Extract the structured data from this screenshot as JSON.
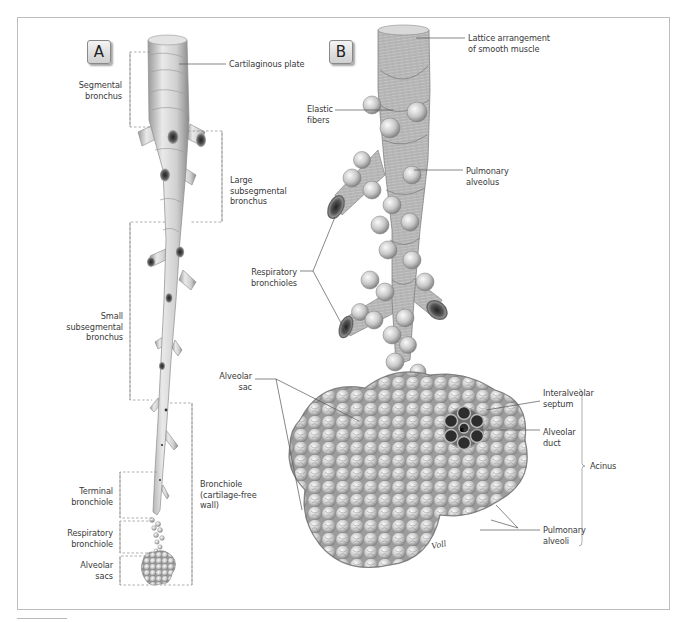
{
  "panels": [
    {
      "id": "A",
      "badge": "A"
    },
    {
      "id": "B",
      "badge": "B"
    }
  ],
  "panelA": {
    "labels": {
      "cartilaginous_plate": "Cartilaginous plate",
      "segmental_bronchus": "Segmental\nbronchus",
      "large_subsegmental_bronchus": "Large\nsubsegmental\nbronchus",
      "small_subsegmental_bronchus": "Small\nsubsegmental\nbronchus",
      "bronchiole": "Bronchiole\n(cartilage-free\nwall)",
      "terminal_bronchiole": "Terminal\nbronchiole",
      "respiratory_bronchiole": "Respiratory\nbronchiole",
      "alveolar_sacs": "Alveolar\nsacs"
    }
  },
  "panelB": {
    "labels": {
      "lattice_smooth_muscle": "Lattice arrangement\nof smooth muscle",
      "elastic_fibers": "Elastic\nfibers",
      "pulmonary_alveolus": "Pulmonary\nalveolus",
      "respiratory_bronchioles": "Respiratory\nbronchioles",
      "alveolar_sac": "Alveolar\nsac",
      "interalveolar_septum": "Interalveolar\nseptum",
      "alveolar_duct": "Alveolar\nduct",
      "acinus": "Acinus",
      "pulmonary_alveoli": "Pulmonary\nalveoli"
    },
    "signature": "Voll"
  },
  "colors": {
    "frame": "#bdbdbd",
    "leader": "#555555",
    "tissue_light": "#e6e6e6",
    "tissue_mid": "#b5b5b5",
    "tissue_dark": "#6e6e6e"
  }
}
